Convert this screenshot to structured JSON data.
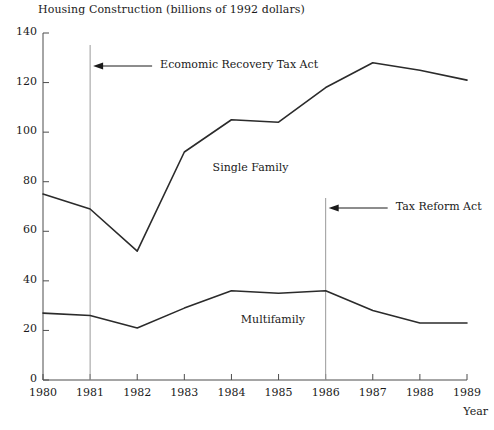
{
  "chart_data": {
    "type": "line",
    "title": "Housing Construction (billions of 1992 dollars)",
    "xlabel": "Year",
    "ylabel": "",
    "xlim": [
      1980,
      1989
    ],
    "ylim": [
      0,
      140
    ],
    "grid": false,
    "legend_position": "inline-labels",
    "categories": [
      1980,
      1981,
      1982,
      1983,
      1984,
      1985,
      1986,
      1987,
      1988,
      1989
    ],
    "series": [
      {
        "name": "Single Family",
        "values": [
          75,
          69,
          52,
          92,
          105,
          104,
          118,
          128,
          125,
          121
        ]
      },
      {
        "name": "Multifamily",
        "values": [
          27,
          26,
          21,
          29,
          36,
          35,
          36,
          28,
          23,
          23
        ]
      }
    ],
    "yticks": [
      0,
      20,
      40,
      60,
      80,
      100,
      120,
      140
    ],
    "xticks": [
      1980,
      1981,
      1982,
      1983,
      1984,
      1985,
      1986,
      1987,
      1988,
      1989
    ],
    "annotations": [
      {
        "text": "Ecomomic Recovery Tax Act",
        "marker_x": 1981,
        "arrow": "left"
      },
      {
        "text": "Tax Reform Act",
        "marker_x": 1986,
        "arrow": "left"
      }
    ],
    "series_labels": [
      {
        "text": "Single Family",
        "x": 1983.6,
        "y": 85
      },
      {
        "text": "Multifamily",
        "x": 1984.2,
        "y": 24
      }
    ],
    "colors": {
      "line": "#2b2b2b",
      "axis": "#4d4d4d",
      "marker_line": "#9a9a9a",
      "text": "#1a1a1a",
      "background": "#ffffff"
    }
  }
}
